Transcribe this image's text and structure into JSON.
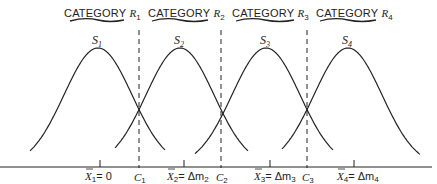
{
  "categories": [
    {
      "label": "CATEGORY",
      "var": "R",
      "sub": "1"
    },
    {
      "label": "CATEGORY",
      "var": "R",
      "sub": "2"
    },
    {
      "label": "CATEGORY",
      "var": "R",
      "sub": "3"
    },
    {
      "label": "CATEGORY",
      "var": "R",
      "sub": "4"
    }
  ],
  "distributions": [
    {
      "var": "S",
      "sub": "1",
      "mean_label": "X̅₁ = 0"
    },
    {
      "var": "S",
      "sub": "2",
      "mean_label": "X̅₂ = Δm₂"
    },
    {
      "var": "S",
      "sub": "3",
      "mean_label": "X̅₃ = Δm₃"
    },
    {
      "var": "S",
      "sub": "4",
      "mean_label": "X̅₄ = Δm₄"
    }
  ],
  "criteria": [
    {
      "var": "C",
      "sub": "1"
    },
    {
      "var": "C",
      "sub": "2"
    },
    {
      "var": "C",
      "sub": "3"
    }
  ],
  "means": [
    {
      "var": "X",
      "sub": "1",
      "eq": "= 0"
    },
    {
      "var": "X",
      "sub": "2",
      "eq": "= Δm",
      "eq_sub": "2"
    },
    {
      "var": "X",
      "sub": "3",
      "eq": "= Δm",
      "eq_sub": "3"
    },
    {
      "var": "X",
      "sub": "4",
      "eq": "= Δm",
      "eq_sub": "4"
    }
  ],
  "colors": {
    "ink": "#222222",
    "background": "#ffffff"
  }
}
